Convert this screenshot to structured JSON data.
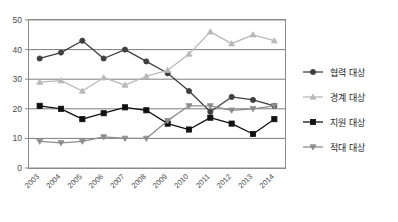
{
  "chart_data": {
    "type": "line",
    "title": "",
    "subtitle": "",
    "xlabel": "",
    "ylabel": "",
    "categories": [
      "2003",
      "2004",
      "2005",
      "2006",
      "2007",
      "2008",
      "2009",
      "2010",
      "2011",
      "2012",
      "2013",
      "2014"
    ],
    "x": [
      2003,
      2004,
      2005,
      2006,
      2007,
      2008,
      2009,
      2010,
      2011,
      2012,
      2013,
      2014
    ],
    "ylim": [
      0,
      50
    ],
    "yticks": [
      0,
      10,
      20,
      30,
      40,
      50
    ],
    "ytick_labels": [
      "0",
      "10",
      "20",
      "30",
      "40",
      "50"
    ],
    "grid": "horizontal",
    "legend_position": "right",
    "series": [
      {
        "name": "협력 대상",
        "marker": "circle",
        "color": "#3f3f3f",
        "values": [
          37,
          39,
          43,
          37,
          40,
          36,
          32,
          26,
          19,
          24,
          23,
          21
        ]
      },
      {
        "name": "경계 대상",
        "marker": "triangle",
        "color": "#b9b9b9",
        "values": [
          29,
          29.5,
          26,
          30.5,
          28,
          31,
          33,
          38.5,
          46,
          42,
          45,
          43
        ]
      },
      {
        "name": "지원 대상",
        "marker": "square",
        "color": "#111111",
        "values": [
          21,
          20,
          16.5,
          18.5,
          20.5,
          19.5,
          15,
          13,
          17,
          15,
          11.5,
          16.5
        ]
      },
      {
        "name": "적대 대상",
        "marker": "triangle-down",
        "color": "#8d8d8d",
        "values": [
          9,
          8.5,
          9,
          10.5,
          10,
          10,
          16,
          21,
          21,
          19.5,
          20,
          21
        ]
      }
    ]
  },
  "legend": {
    "items": [
      {
        "label": "협력 대상"
      },
      {
        "label": "경계 대상"
      },
      {
        "label": "지원 대상"
      },
      {
        "label": "적대 대상"
      }
    ]
  },
  "axes": {
    "y_labels": [
      "50",
      "40",
      "30",
      "20",
      "10",
      "0"
    ],
    "x_labels": [
      "2003",
      "2004",
      "2005",
      "2006",
      "2007",
      "2008",
      "2009",
      "2010",
      "2011",
      "2012",
      "2013",
      "2014"
    ]
  }
}
